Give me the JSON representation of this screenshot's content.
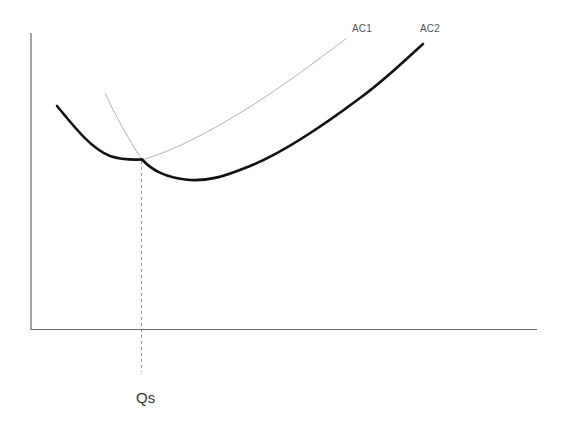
{
  "diagram": {
    "type": "economics-cost-curves",
    "colors": {
      "axis": "#666666",
      "thin_curve": "#b0b0b0",
      "bold_curve": "#111111",
      "dashed_line": "#888888",
      "label": "#555555"
    },
    "curves": [
      {
        "id": "AC1",
        "label": "AC1",
        "style": "thin"
      },
      {
        "id": "AC2",
        "label": "AC2",
        "style": "thin-and-bold"
      }
    ],
    "labels": {
      "ac1": "AC1",
      "ac2": "AC2",
      "quantity_marker": "Qs"
    },
    "marker": {
      "name": "Qs",
      "meaning": "Output level where AC1 and AC2 intersect"
    },
    "axes": {
      "x_label": "",
      "y_label": ""
    }
  }
}
